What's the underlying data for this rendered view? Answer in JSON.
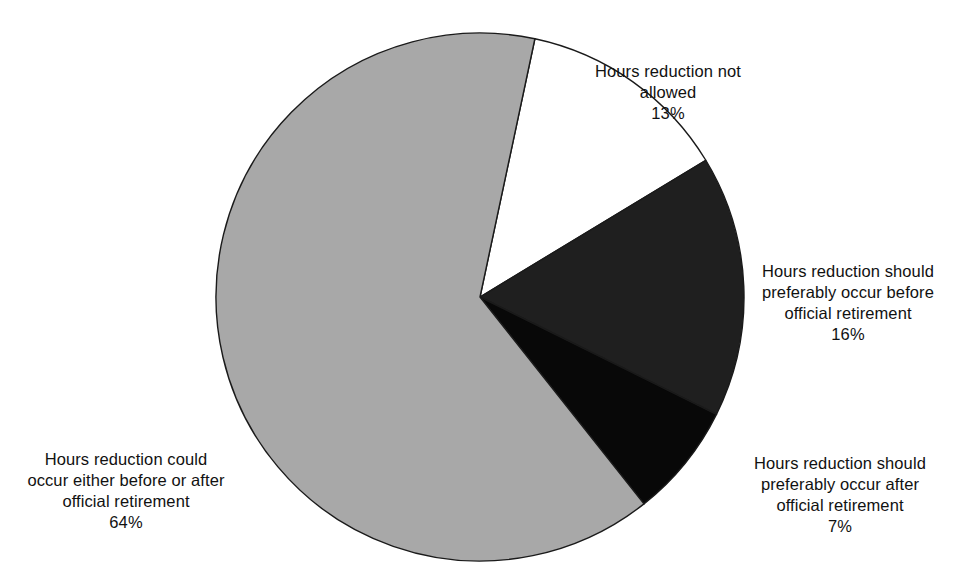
{
  "chart_data": {
    "type": "pie",
    "title": "",
    "subtitle": "",
    "xlabel": "",
    "ylabel": "",
    "grid": false,
    "legend_position": "none",
    "labels_outside": true,
    "start_angle_deg": 12,
    "direction": "clockwise",
    "categories": [
      "Hours reduction not allowed",
      "Hours reduction should preferably occur before official retirement",
      "Hours reduction should preferably occur after official retirement",
      "Hours reduction could occur either before or after official retirement"
    ],
    "values": [
      13,
      16,
      7,
      64
    ],
    "value_unit": "%",
    "colors": [
      "#ffffff",
      "#1f1f1f",
      "#080808",
      "#a8a8a8"
    ],
    "slices": [
      {
        "name": "not-allowed",
        "label_lines": [
          "Hours reduction not",
          "allowed"
        ],
        "value": 13,
        "value_text": "13%",
        "color": "#ffffff",
        "stroke": "#1a1a1a"
      },
      {
        "name": "before-retirement",
        "label_lines": [
          "Hours reduction should",
          "preferably occur before",
          "official retirement"
        ],
        "value": 16,
        "value_text": "16%",
        "color": "#1f1f1f",
        "stroke": "#1a1a1a"
      },
      {
        "name": "after-retirement",
        "label_lines": [
          "Hours reduction should",
          "preferably occur after",
          "official retirement"
        ],
        "value": 7,
        "value_text": "7%",
        "color": "#080808",
        "stroke": "#1a1a1a"
      },
      {
        "name": "either-before-or-after",
        "label_lines": [
          "Hours reduction could",
          "occur either before or after",
          "official retirement"
        ],
        "value": 64,
        "value_text": "64%",
        "color": "#a8a8a8",
        "stroke": "#1a1a1a"
      }
    ]
  },
  "labels": {
    "not_allowed_text": "Hours reduction not\nallowed",
    "not_allowed_pct": "13%",
    "before_text": "Hours reduction should\npreferably occur before\nofficial retirement",
    "before_pct": "16%",
    "after_text": "Hours reduction should\npreferably occur after\nofficial retirement",
    "after_pct": "7%",
    "either_text": "Hours reduction could\noccur either before or after\nofficial retirement",
    "either_pct": "64%"
  }
}
